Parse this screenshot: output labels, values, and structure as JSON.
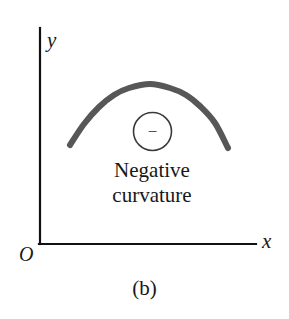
{
  "figure": {
    "caption": "(b)",
    "background_color": "#ffffff"
  },
  "axes": {
    "y_label": "y",
    "x_label": "x",
    "origin_label": "O",
    "axis_color": "#111111",
    "axis_width_px": 2,
    "y_axis": {
      "x": 40,
      "y_top": 28,
      "y_bottom": 244
    },
    "x_axis": {
      "y": 244,
      "x_left": 40,
      "x_right": 256
    }
  },
  "annotation": {
    "line1": "Negative",
    "line2": "curvature",
    "sign_symbol": "−",
    "badge_shape": "circle",
    "badge_center": {
      "x": 152,
      "y": 132
    },
    "badge_radius": 19,
    "badge_stroke_color": "#3a3a3a"
  },
  "chart_data": {
    "type": "line",
    "title": "(b)",
    "xlabel": "x",
    "ylabel": "y",
    "grid": false,
    "legend": null,
    "curve_color": "#575757",
    "curve_width_px": 6,
    "annotations": [
      "−",
      "Negative",
      "curvature"
    ],
    "x": [
      70,
      84,
      99,
      114,
      129,
      150,
      170,
      186,
      201,
      215,
      228
    ],
    "y": [
      145,
      124,
      107,
      95,
      88,
      84,
      88,
      95,
      107,
      123,
      148
    ],
    "xlim": [
      40,
      256
    ],
    "ylim": [
      244,
      28
    ],
    "endpoints": {
      "left": [
        70,
        145
      ],
      "apex": [
        150,
        84
      ],
      "right": [
        228,
        148
      ]
    }
  }
}
